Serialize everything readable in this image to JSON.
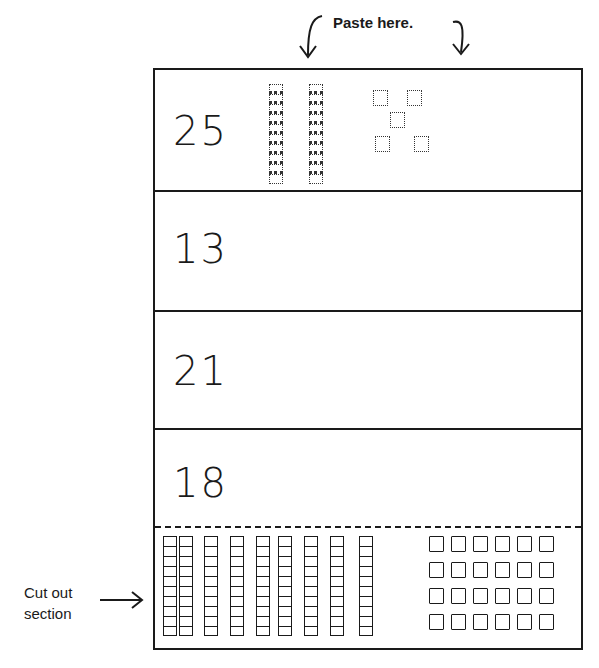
{
  "instructions": {
    "paste_label": "Paste here.",
    "cut_label_line1": "Cut out",
    "cut_label_line2": "section"
  },
  "rows": [
    {
      "number": "25",
      "tens_pasted": 2,
      "ones_pasted": 5
    },
    {
      "number": "13",
      "tens_pasted": 0,
      "ones_pasted": 0
    },
    {
      "number": "21",
      "tens_pasted": 0,
      "ones_pasted": 0
    },
    {
      "number": "18",
      "tens_pasted": 0,
      "ones_pasted": 0
    }
  ],
  "cut_out_section": {
    "ten_rods": 9,
    "unit_squares": 24,
    "unit_grid": {
      "columns": 6,
      "rows": 4
    }
  },
  "colors": {
    "ink": "#1a1a1a",
    "paper": "#ffffff"
  }
}
